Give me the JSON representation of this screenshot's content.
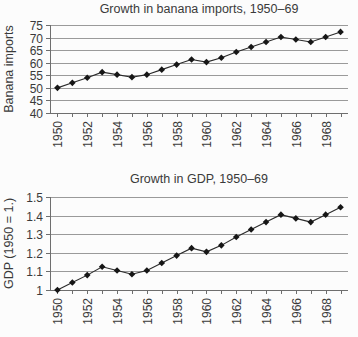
{
  "page": {
    "background": "#fcfcfc",
    "text_color": "#3a3a3a"
  },
  "chart_data": [
    {
      "type": "line",
      "title": "Growth in banana imports, 1950–69",
      "ylabel": "Banana imports",
      "xlabel": "",
      "x": [
        1950,
        1951,
        1952,
        1953,
        1954,
        1955,
        1956,
        1957,
        1958,
        1959,
        1960,
        1961,
        1962,
        1963,
        1964,
        1965,
        1966,
        1967,
        1968,
        1969
      ],
      "series": [
        {
          "name": "Banana imports",
          "values": [
            50,
            52,
            54,
            56.25,
            55.25,
            54.25,
            55.25,
            57.25,
            59.25,
            61.25,
            60.25,
            62,
            64.25,
            66.25,
            68.25,
            70.25,
            69.25,
            68.25,
            70.25,
            72.25
          ]
        }
      ],
      "ylim": [
        40,
        75
      ],
      "yticks": [
        40,
        45,
        50,
        55,
        60,
        65,
        70,
        75
      ],
      "ytick_labels": [
        "40",
        "45",
        "50",
        "55",
        "60",
        "65",
        "70",
        "75"
      ],
      "xtick_labeled_years": [
        1950,
        1952,
        1954,
        1956,
        1958,
        1960,
        1962,
        1964,
        1966,
        1968
      ],
      "grid": "horizontal",
      "legend": "none",
      "marker": "diamond",
      "colors": {
        "line": "#2a2a2a",
        "marker": "#161616",
        "grid": "#9a9a9a",
        "axis": "#6e6e6e",
        "text": "#3a3a3a"
      }
    },
    {
      "type": "line",
      "title": "Growth in GDP, 1950–69",
      "ylabel": "GDP (1950 = 1.)",
      "xlabel": "",
      "x": [
        1950,
        1951,
        1952,
        1953,
        1954,
        1955,
        1956,
        1957,
        1958,
        1959,
        1960,
        1961,
        1962,
        1963,
        1964,
        1965,
        1966,
        1967,
        1968,
        1969
      ],
      "series": [
        {
          "name": "GDP (1950 = 1.)",
          "values": [
            1.0,
            1.04,
            1.08,
            1.125,
            1.105,
            1.085,
            1.105,
            1.145,
            1.185,
            1.225,
            1.205,
            1.24,
            1.285,
            1.325,
            1.365,
            1.405,
            1.385,
            1.365,
            1.405,
            1.445
          ]
        }
      ],
      "ylim": [
        1,
        1.5
      ],
      "yticks": [
        1,
        1.1,
        1.2,
        1.3,
        1.4,
        1.5
      ],
      "ytick_labels": [
        "1",
        "1.1",
        "1.2",
        "1.3",
        "1.4",
        "1.5"
      ],
      "xtick_labeled_years": [
        1950,
        1952,
        1954,
        1956,
        1958,
        1960,
        1962,
        1964,
        1966,
        1968
      ],
      "grid": "horizontal",
      "legend": "none",
      "marker": "diamond",
      "colors": {
        "line": "#2a2a2a",
        "marker": "#161616",
        "grid": "#9a9a9a",
        "axis": "#6e6e6e",
        "text": "#3a3a3a"
      }
    }
  ]
}
